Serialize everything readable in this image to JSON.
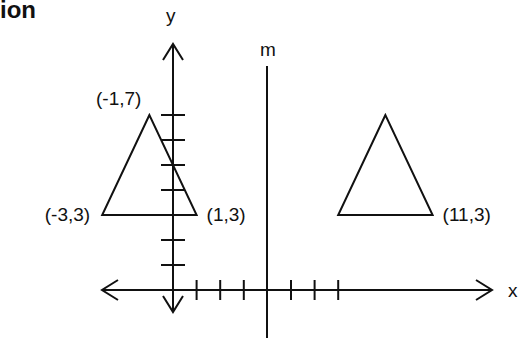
{
  "title_fragment": "ion",
  "axes": {
    "x_label": "x",
    "y_label": "y",
    "x_ticks_positive": 7,
    "x_ticks_negative": 0,
    "y_ticks_positive": 7
  },
  "mirror_line": {
    "label": "m",
    "x": 4
  },
  "triangles": [
    {
      "name": "original",
      "vertices": [
        [
          -1,
          7
        ],
        [
          -3,
          3
        ],
        [
          1,
          3
        ]
      ],
      "labels": [
        "(-1,7)",
        "(-3,3)",
        "(1,3)"
      ]
    },
    {
      "name": "image",
      "vertices": [
        [
          9,
          7
        ],
        [
          7,
          3
        ],
        [
          11,
          3
        ]
      ],
      "labels": [
        "",
        "",
        "(11,3)"
      ]
    }
  ]
}
